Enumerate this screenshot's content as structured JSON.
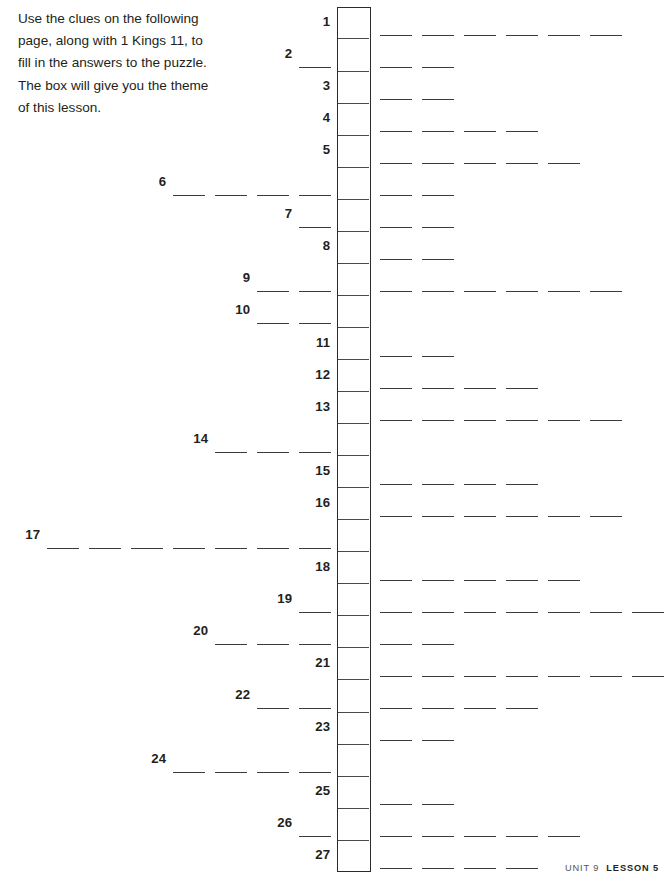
{
  "instructions": {
    "lines": [
      "Use the clues on the following",
      "page, along with 1 Kings 11, to",
      "fill in the answers to the puzzle.",
      "The box will give you the theme",
      "of this lesson."
    ]
  },
  "puzzle": {
    "total_rows": 27,
    "box": {
      "left": 337,
      "top": 7,
      "width": 34,
      "cell_height": 32.05,
      "border_color": "#2b2b2b",
      "divider_color": "#4a4a4a"
    },
    "blank": {
      "width": 32,
      "pitch": 42,
      "color": "#3a3a3a"
    },
    "rows": [
      {
        "number": "1",
        "left_blanks": 0,
        "right_blanks": 6
      },
      {
        "number": "2",
        "left_blanks": 1,
        "right_blanks": 2
      },
      {
        "number": "3",
        "left_blanks": 0,
        "right_blanks": 2
      },
      {
        "number": "4",
        "left_blanks": 0,
        "right_blanks": 4
      },
      {
        "number": "5",
        "left_blanks": 0,
        "right_blanks": 5
      },
      {
        "number": "6",
        "left_blanks": 4,
        "right_blanks": 2
      },
      {
        "number": "7",
        "left_blanks": 1,
        "right_blanks": 2
      },
      {
        "number": "8",
        "left_blanks": 0,
        "right_blanks": 2
      },
      {
        "number": "9",
        "left_blanks": 2,
        "right_blanks": 6
      },
      {
        "number": "10",
        "left_blanks": 2,
        "right_blanks": 0
      },
      {
        "number": "11",
        "left_blanks": 0,
        "right_blanks": 2
      },
      {
        "number": "12",
        "left_blanks": 0,
        "right_blanks": 4
      },
      {
        "number": "13",
        "left_blanks": 0,
        "right_blanks": 6
      },
      {
        "number": "14",
        "left_blanks": 3,
        "right_blanks": 0
      },
      {
        "number": "15",
        "left_blanks": 0,
        "right_blanks": 4
      },
      {
        "number": "16",
        "left_blanks": 0,
        "right_blanks": 6
      },
      {
        "number": "17",
        "left_blanks": 7,
        "right_blanks": 0
      },
      {
        "number": "18",
        "left_blanks": 0,
        "right_blanks": 5
      },
      {
        "number": "19",
        "left_blanks": 1,
        "right_blanks": 8
      },
      {
        "number": "20",
        "left_blanks": 3,
        "right_blanks": 2
      },
      {
        "number": "21",
        "left_blanks": 0,
        "right_blanks": 8
      },
      {
        "number": "22",
        "left_blanks": 2,
        "right_blanks": 4
      },
      {
        "number": "23",
        "left_blanks": 0,
        "right_blanks": 2
      },
      {
        "number": "24",
        "left_blanks": 4,
        "right_blanks": 0
      },
      {
        "number": "25",
        "left_blanks": 0,
        "right_blanks": 2
      },
      {
        "number": "26",
        "left_blanks": 1,
        "right_blanks": 5
      },
      {
        "number": "27",
        "left_blanks": 0,
        "right_blanks": 4
      }
    ]
  },
  "footer": {
    "unit": "UNIT 9",
    "lesson": "LESSON 5"
  }
}
